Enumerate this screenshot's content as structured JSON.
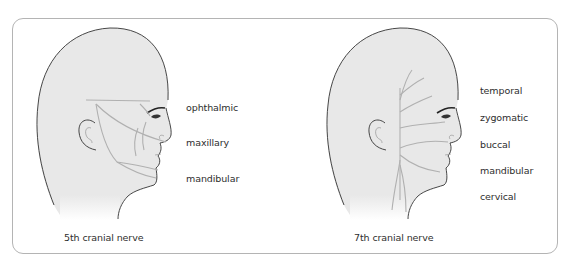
{
  "panels": [
    {
      "id": "fifth",
      "caption": "5th cranial nerve",
      "branches": [
        "ophthalmic",
        "maxillary",
        "mandibular"
      ]
    },
    {
      "id": "seventh",
      "caption": "7th cranial nerve",
      "branches": [
        "temporal",
        "zygomatic",
        "buccal",
        "mandibular",
        "cervical"
      ]
    }
  ],
  "colors": {
    "outline": "#333333",
    "fill": "#e8e8e8",
    "nerve": "#b0b0b0",
    "frame": "#b4b4b4",
    "text": "#2e2e2e"
  }
}
